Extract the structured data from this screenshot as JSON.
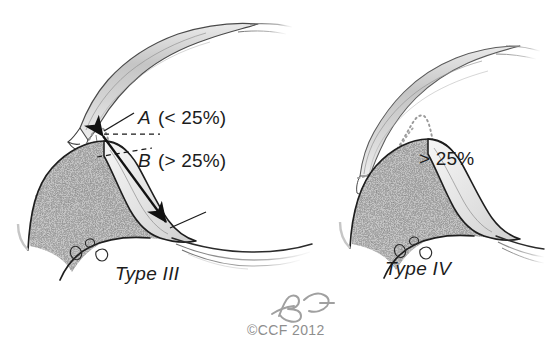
{
  "figure": {
    "background_color": "#ffffff",
    "ink_color": "#1c1c1c",
    "bone_fill_color": "#d6d6d6",
    "tendon_fill_color": "#cfcfcf",
    "dotted_outline_color": "#9a9a9a",
    "credit_color": "#8e8e8e"
  },
  "panels": {
    "left": {
      "type_label": "Type III",
      "measure_a": {
        "variable": "A",
        "range": "(< 25%)"
      },
      "measure_b": {
        "variable": "B",
        "range": "(> 25%)"
      }
    },
    "right": {
      "type_label": "Type IV",
      "percent_label": "> 25%"
    }
  },
  "credit": {
    "signature": "BG",
    "copyright": "©CCF 2012"
  }
}
